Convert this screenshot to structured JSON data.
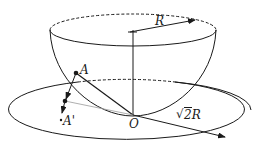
{
  "diagram": {
    "type": "geometry-physics",
    "labels": {
      "radius_top": "R",
      "radius_plane": "2R",
      "radius_plane_sqrt": "√",
      "point_A": "A",
      "point_A_prime": "A'",
      "origin": "O"
    },
    "colors": {
      "stroke": "#1a1a1a",
      "faint_line": "#9a9a9a",
      "background": "#ffffff"
    }
  }
}
